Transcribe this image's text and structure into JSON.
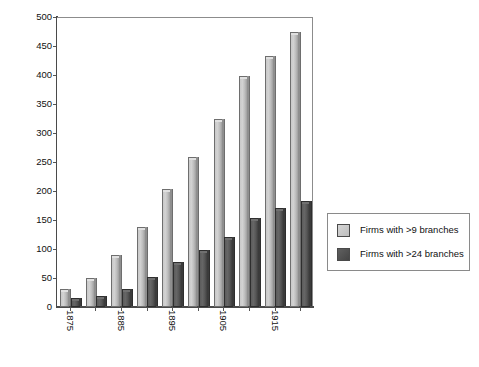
{
  "chart_data": {
    "type": "bar",
    "title": "",
    "subtitle": "",
    "xlabel": "",
    "ylabel": "",
    "ylim": [
      0,
      500
    ],
    "yticks": [
      0,
      50,
      100,
      150,
      200,
      250,
      300,
      350,
      400,
      450,
      500
    ],
    "grid": false,
    "legend_position": "right",
    "categories": [
      "1875",
      "1880",
      "1885",
      "1890",
      "1895",
      "1900",
      "1905",
      "1910",
      "1915",
      "1920"
    ],
    "tick_labels": [
      "1875",
      "",
      "1885",
      "",
      "1895",
      "",
      "1905",
      "",
      "1915",
      ""
    ],
    "series": [
      {
        "name": "Firms with >9 branches",
        "color": "#c9c9c9",
        "values": [
          28,
          47,
          87,
          135,
          200,
          255,
          320,
          395,
          430,
          470
        ]
      },
      {
        "name": "Firms with >24 branches",
        "color": "#565656",
        "values": [
          12,
          16,
          27,
          48,
          74,
          95,
          118,
          150,
          168,
          180
        ]
      }
    ]
  },
  "legend": {
    "items": [
      {
        "label": "Firms with >9 branches",
        "swatch": "light"
      },
      {
        "label": "Firms with >24 branches",
        "swatch": "dark"
      }
    ]
  },
  "colors": {
    "series_light": "#c9c9c9",
    "series_dark": "#565656",
    "axis": "#4a4a4a",
    "frame": "#8c8c8c",
    "background": "#ffffff",
    "text": "#111111"
  }
}
